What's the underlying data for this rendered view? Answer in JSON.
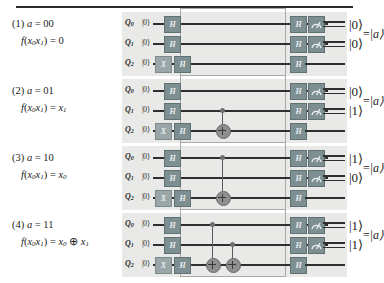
{
  "figure": {
    "top_rule": true,
    "qubit_labels": [
      "Q0",
      "Q1",
      "Q2"
    ],
    "input_ket": "|0⟩",
    "gate_labels": {
      "hadamard": "H",
      "pauli_x": "X"
    },
    "measure_icon": "measurement-meter-icon",
    "output_equals": "=",
    "output_a_ket": "|a⟩"
  },
  "rows": [
    {
      "index": "(1)",
      "a_label": "a = 00",
      "f_label": "f(x₀x₁) = 0",
      "a_value": "00",
      "oracle_type": "identity",
      "cnots": [],
      "outputs": [
        "|0⟩",
        "|0⟩"
      ]
    },
    {
      "index": "(2)",
      "a_label": "a = 01",
      "f_label": "f(x₀x₁) = x₁",
      "a_value": "01",
      "oracle_type": "cnot-q1-q2",
      "cnots": [
        {
          "control": "Q1",
          "target": "Q2"
        }
      ],
      "outputs": [
        "|0⟩",
        "|1⟩"
      ]
    },
    {
      "index": "(3)",
      "a_label": "a = 10",
      "f_label": "f(x₀x₁) = x₀",
      "a_value": "10",
      "oracle_type": "cnot-q0-q2",
      "cnots": [
        {
          "control": "Q0",
          "target": "Q2"
        }
      ],
      "outputs": [
        "|1⟩",
        "|0⟩"
      ]
    },
    {
      "index": "(4)",
      "a_label": "a = 11",
      "f_label": "f(x₀x₁) = x₀ ⊕ x₁",
      "a_value": "11",
      "oracle_type": "cnot-q0-q2 + cnot-q1-q2",
      "cnots": [
        {
          "control": "Q0",
          "target": "Q2"
        },
        {
          "control": "Q1",
          "target": "Q2"
        }
      ],
      "outputs": [
        "|1⟩",
        "|1⟩"
      ]
    }
  ],
  "colors": {
    "gate_fill": "#7e8f92",
    "gate_fill_light": "#9aa6a8",
    "panel_bg": "#e9e9e7",
    "wire": "#2f2f2f",
    "oracle_border": "#a8a8a6"
  }
}
